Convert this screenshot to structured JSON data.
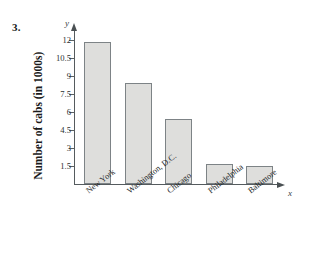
{
  "problem": {
    "number": "3."
  },
  "axes": {
    "y_name": "y",
    "x_name": "x",
    "y_title": "Number of cabs (in 1000s)"
  },
  "chart_data": {
    "type": "bar",
    "title": "",
    "subtitle": "",
    "xlabel": "",
    "ylabel": "Number of cabs (in 1000s)",
    "categories": [
      "New York",
      "Washington, D.C.",
      "Chicago",
      "Philadelphia",
      "Baltimore"
    ],
    "values": [
      11.8,
      8.4,
      5.4,
      1.6,
      1.45
    ],
    "series": [
      {
        "name": "Number of cabs (in 1000s)",
        "values": [
          11.8,
          8.4,
          5.4,
          1.6,
          1.45
        ]
      }
    ],
    "ylim": [
      0,
      12.8
    ],
    "yticks": [
      1.5,
      3,
      4.5,
      6,
      7.5,
      9,
      10.5,
      12
    ],
    "ytick_labels": [
      "1.5",
      "3",
      "4.5",
      "6",
      "7.5",
      "9",
      "10.5",
      "12"
    ],
    "grid": false,
    "legend": false,
    "legend_position": "none",
    "bar_fill_color": "#dededc",
    "bar_border_color": "#7d8386",
    "axis_color": "#555b5e",
    "category_label_rotation": -38,
    "annotations": []
  }
}
